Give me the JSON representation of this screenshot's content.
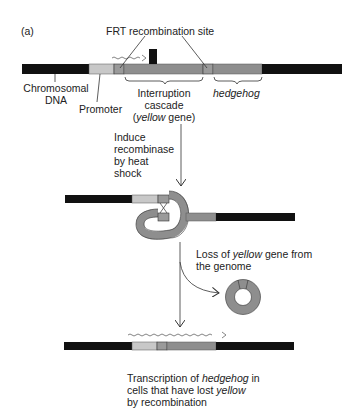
{
  "figure": {
    "panel_label": "(a)",
    "colors": {
      "chromosomal_dna": "#111111",
      "promoter": "#c8c8c8",
      "frt_site": "#9a9a9a",
      "interruption_cascade": "#8e8e8e",
      "hedgehog": "#8e8e8e",
      "lines": "#333333"
    },
    "top_construct": {
      "frt_label": "FRT recombination site",
      "chromosomal_label_line1": "Chromosomal",
      "chromosomal_label_line2": "DNA",
      "promoter_label": "Promoter",
      "interruption_line1": "Interruption",
      "interruption_line2": "cascade",
      "interruption_line3_italic": "yellow",
      "interruption_line3_rest": " gene)",
      "interruption_line3_open": "(",
      "hedgehog_label": "hedgehog"
    },
    "step1": {
      "line1": "Induce",
      "line2": "recombinase",
      "line3": "by heat",
      "line4": "shock"
    },
    "step2": {
      "line1_pre": "Loss of ",
      "line1_italic": "yellow",
      "line1_post": " gene from",
      "line2": "the genome"
    },
    "result": {
      "line1_pre": "Transcription of ",
      "line1_italic": "hedgehog",
      "line1_post": " in",
      "line2_pre": "cells that have lost ",
      "line2_italic": "yellow",
      "line3": "by recombination"
    }
  }
}
